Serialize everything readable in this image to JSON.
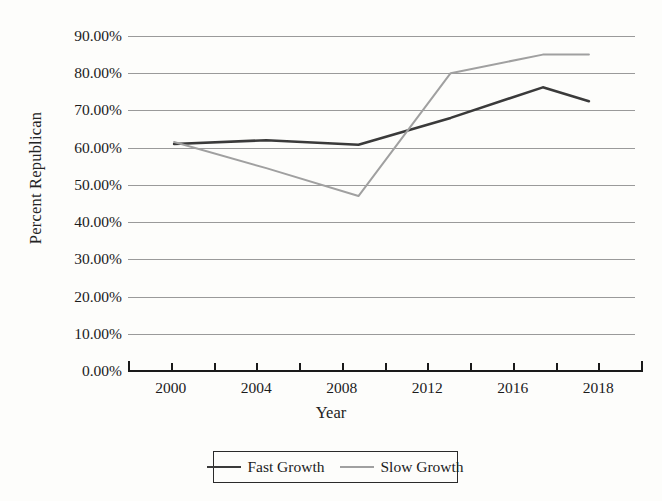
{
  "chart_data": {
    "type": "line",
    "title": "",
    "xlabel": "Year",
    "ylabel": "Percent Republican",
    "categories": [
      "2000",
      "2004",
      "2008",
      "2012",
      "2016",
      "2018"
    ],
    "x": [
      2000,
      2004,
      2008,
      2012,
      2016,
      2018
    ],
    "xlim": [
      1998,
      2020
    ],
    "ylim": [
      0,
      90
    ],
    "ytick_labels": [
      "0.00%",
      "10.00%",
      "20.00%",
      "30.00%",
      "40.00%",
      "50.00%",
      "60.00%",
      "70.00%",
      "80.00%",
      "90.00%"
    ],
    "ytick_values": [
      0,
      10,
      20,
      30,
      40,
      50,
      60,
      70,
      80,
      90
    ],
    "xtick_labels": [
      "2000",
      "2004",
      "2008",
      "2012",
      "2016",
      "2018"
    ],
    "grid": "horizontal",
    "legend_position": "bottom",
    "series": [
      {
        "name": "Fast Growth",
        "color": "#3a3a3a",
        "values": [
          61.0,
          62.0,
          60.8,
          68.0,
          76.2,
          72.5
        ]
      },
      {
        "name": "Slow Growth",
        "color": "#a0a0a0",
        "values": [
          61.5,
          54.5,
          47.0,
          80.0,
          85.0,
          85.0
        ]
      }
    ]
  },
  "axes": {
    "y_title": "Percent Republican",
    "x_title": "Year"
  },
  "legend": {
    "entries": [
      {
        "label": "Fast Growth",
        "color": "#3a3a3a"
      },
      {
        "label": "Slow Growth",
        "color": "#a0a0a0"
      }
    ]
  }
}
